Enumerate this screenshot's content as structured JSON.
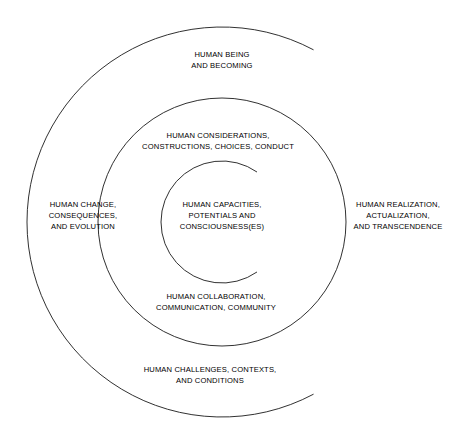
{
  "diagram": {
    "type": "concentric-rings",
    "background_color": "#ffffff",
    "stroke_color": "#1a1a1a",
    "text_color": "#000000",
    "center": {
      "x": 222,
      "y": 222
    },
    "rings": [
      {
        "id": "outer",
        "name": "outer-ring",
        "radius": 195,
        "shape": "arc-open-right",
        "gap_start_deg": -62,
        "gap_end_deg": 62
      },
      {
        "id": "middle",
        "name": "middle-ring",
        "radius": 124,
        "shape": "full-circle",
        "gap_start_deg": 0,
        "gap_end_deg": 0
      },
      {
        "id": "inner",
        "name": "inner-ring",
        "radius": 61,
        "shape": "arc-open-right",
        "gap_start_deg": -55,
        "gap_end_deg": 55
      }
    ],
    "labels": [
      {
        "id": "human-being",
        "name": "label-human-being-and-becoming",
        "ring": "outer",
        "position": "top",
        "x": 222,
        "y": 60,
        "lines": [
          "HUMAN BEING",
          "AND BECOMING"
        ]
      },
      {
        "id": "human-considerations",
        "name": "label-human-considerations",
        "ring": "middle",
        "position": "upper",
        "x": 218,
        "y": 141,
        "lines": [
          "HUMAN CONSIDERATIONS,",
          "CONSTRUCTIONS, CHOICES, CONDUCT"
        ]
      },
      {
        "id": "human-capacities",
        "name": "label-human-capacities",
        "ring": "inner",
        "position": "center",
        "x": 222,
        "y": 216,
        "lines": [
          "HUMAN CAPACITIES,",
          "POTENTIALS AND",
          "CONSCIOUSNESS(ES)"
        ]
      },
      {
        "id": "human-change",
        "name": "label-human-change",
        "ring": "outer",
        "position": "left",
        "x": 83,
        "y": 216,
        "lines": [
          "HUMAN CHANGE,",
          "CONSEQUENCES,",
          "AND EVOLUTION"
        ]
      },
      {
        "id": "human-realization",
        "name": "label-human-realization",
        "ring": "outer",
        "position": "right",
        "x": 398,
        "y": 216,
        "lines": [
          "HUMAN REALIZATION,",
          "ACTUALIZATION,",
          "AND TRANSCENDENCE"
        ]
      },
      {
        "id": "human-collaboration",
        "name": "label-human-collaboration",
        "ring": "middle",
        "position": "lower",
        "x": 216,
        "y": 302,
        "lines": [
          "HUMAN COLLABORATION,",
          "COMMUNICATION, COMMUNITY"
        ]
      },
      {
        "id": "human-challenges",
        "name": "label-human-challenges",
        "ring": "outer",
        "position": "bottom",
        "x": 210,
        "y": 375,
        "lines": [
          "HUMAN CHALLENGES, CONTEXTS,",
          "AND CONDITIONS"
        ]
      }
    ]
  }
}
